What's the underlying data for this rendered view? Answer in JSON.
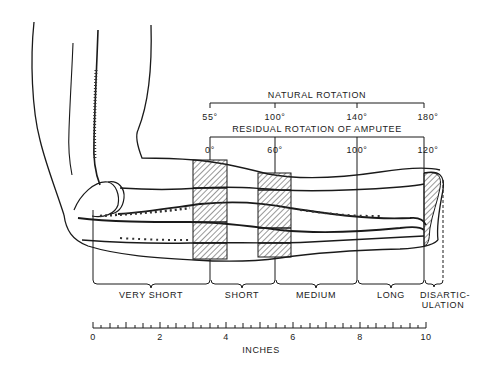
{
  "figure": {
    "natural_rotation": {
      "title": "NATURAL ROTATION",
      "ticks": [
        {
          "label": "55°",
          "x": 210
        },
        {
          "label": "100°",
          "x": 275
        },
        {
          "label": "140°",
          "x": 357
        },
        {
          "label": "180°",
          "x": 424
        }
      ]
    },
    "residual_rotation": {
      "title": "RESIDUAL ROTATION OF AMPUTEE",
      "ticks": [
        {
          "label": "0°",
          "x": 210
        },
        {
          "label": "60°",
          "x": 275
        },
        {
          "label": "100°",
          "x": 357
        },
        {
          "label": "120°",
          "x": 424
        }
      ]
    },
    "levels": [
      {
        "label": "VERY SHORT"
      },
      {
        "label": "SHORT"
      },
      {
        "label": "MEDIUM"
      },
      {
        "label": "LONG"
      },
      {
        "label": "DISARTIC-",
        "label2": "ULATION"
      }
    ],
    "scale": {
      "unit_label": "INCHES",
      "major_labels": [
        "0",
        "2",
        "4",
        "6",
        "8",
        "10"
      ],
      "min": 0,
      "max": 10
    }
  }
}
